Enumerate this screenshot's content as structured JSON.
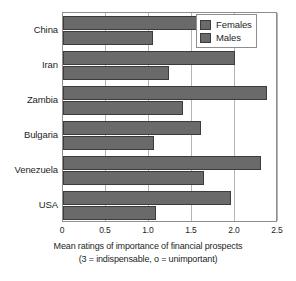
{
  "chart_data": {
    "type": "bar",
    "orientation": "horizontal",
    "title": "",
    "xlabel": "Mean ratings of importance of financial prospects",
    "xlabel_line2": "(3 = indispensable, o = unimportant)",
    "ylabel": "",
    "categories": [
      "China",
      "Iran",
      "Zambia",
      "Bulgaria",
      "Venezuela",
      "USA"
    ],
    "series": [
      {
        "name": "Females",
        "color": "#6a6a6a",
        "values": [
          1.6,
          2.0,
          2.37,
          1.6,
          2.3,
          1.95
        ]
      },
      {
        "name": "Males",
        "color": "#6a6a6a",
        "values": [
          1.05,
          1.23,
          1.4,
          1.06,
          1.64,
          1.08
        ]
      }
    ],
    "xlim": [
      0,
      2.5
    ],
    "xticks": [
      0,
      0.5,
      1.0,
      1.5,
      2.0,
      2.5
    ],
    "xtick_labels": [
      "0",
      "0.5",
      "1.0",
      "1.5",
      "2.0",
      "2.5"
    ],
    "grid": true,
    "grid_axis": "x",
    "legend_position": "top-right",
    "legend_entries": [
      "Females",
      "Males"
    ]
  },
  "colors": {
    "bar_fill": "#6a6a6a",
    "bar_stroke": "#3c3c3c",
    "grid": "#b4b4b4",
    "frame": "#8e8e8e",
    "text": "#231f1e",
    "background": "#ffffff"
  }
}
